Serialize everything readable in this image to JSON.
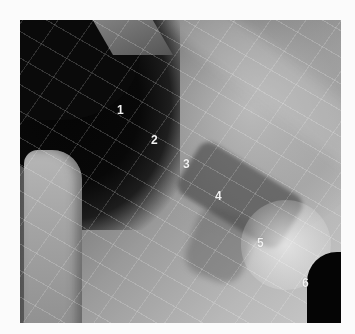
{
  "image": {
    "type": "radiograph",
    "colors": {
      "border": "#fbfbfb",
      "label_text": "#f2f2f2",
      "dark_region": "#050505"
    }
  },
  "labels": [
    {
      "text": "1",
      "x": 117,
      "y": 104
    },
    {
      "text": "2",
      "x": 151,
      "y": 134
    },
    {
      "text": "3",
      "x": 183,
      "y": 158
    },
    {
      "text": "4",
      "x": 215,
      "y": 190
    },
    {
      "text": "5",
      "x": 257,
      "y": 237
    },
    {
      "text": "6",
      "x": 302,
      "y": 277
    }
  ]
}
